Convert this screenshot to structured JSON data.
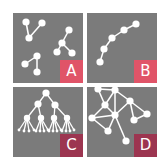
{
  "figure": {
    "background": "#ffffff",
    "panel_color": "#7b7b7b",
    "edge_color": "#ffffff",
    "node_color": "#ffffff",
    "panels": [
      {
        "id": "A",
        "label": "A",
        "label_color": "#e05468",
        "description": "disconnected components",
        "nodes": [
          [
            13,
            9
          ],
          [
            29,
            10
          ],
          [
            16,
            25
          ],
          [
            56,
            17
          ],
          [
            49,
            30
          ],
          [
            44,
            39
          ],
          [
            59,
            40
          ],
          [
            24,
            43
          ],
          [
            12,
            51
          ],
          [
            24,
            59
          ]
        ],
        "edges": [
          [
            0,
            2
          ],
          [
            1,
            2
          ],
          [
            3,
            4
          ],
          [
            4,
            5
          ],
          [
            4,
            6
          ],
          [
            7,
            8
          ],
          [
            7,
            9
          ]
        ]
      },
      {
        "id": "B",
        "label": "B",
        "label_color": "#e05468",
        "description": "path chain",
        "nodes": [
          [
            49,
            11
          ],
          [
            37,
            17
          ],
          [
            25,
            25
          ],
          [
            17,
            36
          ],
          [
            13,
            49
          ]
        ],
        "edges": [
          [
            0,
            1
          ],
          [
            1,
            2
          ],
          [
            2,
            3
          ],
          [
            3,
            4
          ]
        ]
      },
      {
        "id": "C",
        "label": "C",
        "label_color": "#9c3550",
        "description": "tree hierarchy",
        "nodes": [
          [
            33,
            6
          ],
          [
            25,
            17
          ],
          [
            42,
            18
          ],
          [
            14,
            31
          ],
          [
            28,
            31
          ],
          [
            41,
            31
          ],
          [
            54,
            31
          ],
          [
            6,
            43
          ],
          [
            11,
            44
          ],
          [
            16,
            44
          ],
          [
            21,
            43
          ],
          [
            23,
            44
          ],
          [
            27,
            44
          ],
          [
            31,
            44
          ],
          [
            35,
            43
          ],
          [
            36,
            44
          ],
          [
            40,
            44
          ],
          [
            44,
            44
          ],
          [
            48,
            43
          ],
          [
            49,
            44
          ],
          [
            53,
            44
          ],
          [
            57,
            44
          ],
          [
            61,
            43
          ]
        ],
        "edges": [
          [
            0,
            1
          ],
          [
            0,
            2
          ],
          [
            1,
            3
          ],
          [
            1,
            4
          ],
          [
            2,
            5
          ],
          [
            2,
            6
          ],
          [
            3,
            7
          ],
          [
            3,
            8
          ],
          [
            3,
            9
          ],
          [
            3,
            10
          ],
          [
            4,
            11
          ],
          [
            4,
            12
          ],
          [
            4,
            13
          ],
          [
            4,
            14
          ],
          [
            5,
            15
          ],
          [
            5,
            16
          ],
          [
            5,
            17
          ],
          [
            5,
            18
          ],
          [
            6,
            19
          ],
          [
            6,
            20
          ],
          [
            6,
            21
          ],
          [
            6,
            22
          ]
        ]
      },
      {
        "id": "D",
        "label": "D",
        "label_color": "#9c3550",
        "description": "general graph with cycles",
        "nodes": [
          [
            11,
            2
          ],
          [
            28,
            3
          ],
          [
            18,
            18
          ],
          [
            43,
            14
          ],
          [
            5,
            31
          ],
          [
            28,
            28
          ],
          [
            47,
            33
          ],
          [
            60,
            27
          ],
          [
            21,
            44
          ],
          [
            39,
            54
          ]
        ],
        "edges": [
          [
            0,
            1
          ],
          [
            0,
            2
          ],
          [
            1,
            2
          ],
          [
            1,
            3
          ],
          [
            1,
            5
          ],
          [
            2,
            4
          ],
          [
            2,
            5
          ],
          [
            4,
            5
          ],
          [
            4,
            8
          ],
          [
            5,
            8
          ],
          [
            5,
            9
          ],
          [
            3,
            6
          ],
          [
            3,
            7
          ],
          [
            6,
            7
          ],
          [
            3,
            5
          ]
        ]
      }
    ]
  }
}
